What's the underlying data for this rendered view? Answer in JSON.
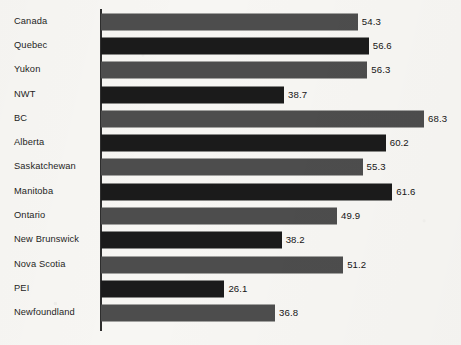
{
  "chart_data": {
    "type": "bar",
    "orientation": "horizontal",
    "title": "",
    "subtitle": "",
    "xlabel": "",
    "ylabel": "",
    "grid": false,
    "legend": "none",
    "xlim": [
      0,
      68.3
    ],
    "axis_origin_value": 0,
    "value_label_precision": 1,
    "categories": [
      "Canada",
      "Quebec",
      "Yukon",
      "NWT",
      "BC",
      "Alberta",
      "Saskatchewan",
      "Manitoba",
      "Ontario",
      "New Brunswick",
      "Nova Scotia",
      "PEI",
      "Newfoundland"
    ],
    "values": [
      54.3,
      56.6,
      56.3,
      38.7,
      68.3,
      60.2,
      55.3,
      61.6,
      49.9,
      38.2,
      51.2,
      26.1,
      36.8
    ],
    "value_labels": [
      "54.3",
      "56.6",
      "56.3",
      "38.7",
      "68.3",
      "60.2",
      "55.3",
      "61.6",
      "49.9",
      "38.2",
      "51.2",
      "26.1",
      "36.8"
    ],
    "bar_tones": [
      "gray",
      "black",
      "gray",
      "black",
      "gray",
      "black",
      "gray",
      "black",
      "gray",
      "black",
      "gray",
      "black",
      "gray"
    ]
  },
  "colors": {
    "background": "#f7f6f3",
    "bar_gray": "#4d4d4d",
    "bar_black": "#1b1b1b",
    "axis_line": "#2e2e2e",
    "category_text": "#1e1e1e",
    "value_text": "#151515"
  },
  "geometry": {
    "axis_x": 101,
    "axis_top": 9,
    "axis_bottom": 331,
    "row_pitch": 24.3,
    "bar_height": 17,
    "px_per_unit": 4.73,
    "value_label_gap": 4
  }
}
